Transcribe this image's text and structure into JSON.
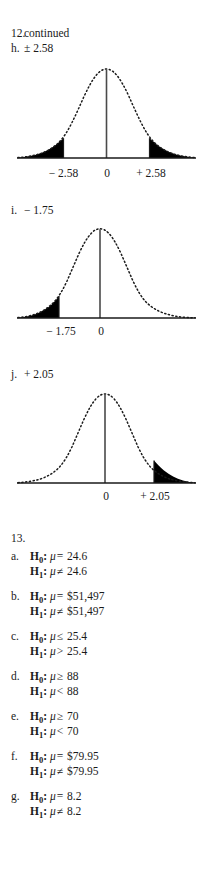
{
  "page": {
    "background": "#ffffff",
    "ink": "#1a1a1a"
  },
  "header": {
    "problem_marker": "12.",
    "problem_text": "continued",
    "sub_marker": "h.",
    "sub_text": "± 2.58"
  },
  "figures": [
    {
      "id": "figure-h",
      "item_marker": "h.",
      "item_value": "± 2.58",
      "curve_type": "normal-distribution",
      "shaded": "two-tails",
      "center_label": "0",
      "left_label": "− 2.58",
      "right_label": "+ 2.58",
      "z_values": [
        -2.58,
        0,
        2.58
      ]
    },
    {
      "id": "figure-i",
      "item_marker": "i.",
      "item_value": "− 1.75",
      "curve_type": "normal-distribution",
      "shaded": "left-tail",
      "center_label": "0",
      "left_label": "− 1.75",
      "right_label": "",
      "z_values": [
        -1.75,
        0
      ]
    },
    {
      "id": "figure-j",
      "item_marker": "j.",
      "item_value": "+ 2.05",
      "curve_type": "normal-distribution",
      "shaded": "right-tail",
      "center_label": "0",
      "left_label": "",
      "right_label": "+ 2.05",
      "z_values": [
        0,
        2.05
      ]
    }
  ],
  "section13": {
    "number": "13.",
    "items": [
      {
        "marker": "a.",
        "null_name": "H",
        "null_sub": "0",
        "null_rel": "=",
        "null_value": "24.6",
        "alt_name": "H",
        "alt_sub": "1",
        "alt_rel": "≠",
        "alt_value": "24.6",
        "param": "μ"
      },
      {
        "marker": "b.",
        "null_name": "H",
        "null_sub": "0",
        "null_rel": "=",
        "null_value": "$51,497",
        "alt_name": "H",
        "alt_sub": "1",
        "alt_rel": "≠",
        "alt_value": "$51,497",
        "param": "μ"
      },
      {
        "marker": "c.",
        "null_name": "H",
        "null_sub": "0",
        "null_rel": "≤",
        "null_value": "25.4",
        "alt_name": "H",
        "alt_sub": "1",
        "alt_rel": ">",
        "alt_value": "25.4",
        "param": "μ"
      },
      {
        "marker": "d.",
        "null_name": "H",
        "null_sub": "0",
        "null_rel": "≥",
        "null_value": "88",
        "alt_name": "H",
        "alt_sub": "1",
        "alt_rel": "<",
        "alt_value": "88",
        "param": "μ"
      },
      {
        "marker": "e.",
        "null_name": "H",
        "null_sub": "0",
        "null_rel": "≥",
        "null_value": "70",
        "alt_name": "H",
        "alt_sub": "1",
        "alt_rel": "<",
        "alt_value": "70",
        "param": "μ"
      },
      {
        "marker": "f.",
        "null_name": "H",
        "null_sub": "0",
        "null_rel": "=",
        "null_value": "$79.95",
        "alt_name": "H",
        "alt_sub": "1",
        "alt_rel": "≠",
        "alt_value": "$79.95",
        "param": "μ"
      },
      {
        "marker": "g.",
        "null_name": "H",
        "null_sub": "0",
        "null_rel": "=",
        "null_value": "8.2",
        "alt_name": "H",
        "alt_sub": "1",
        "alt_rel": "≠",
        "alt_value": "8.2",
        "param": "μ"
      }
    ]
  }
}
